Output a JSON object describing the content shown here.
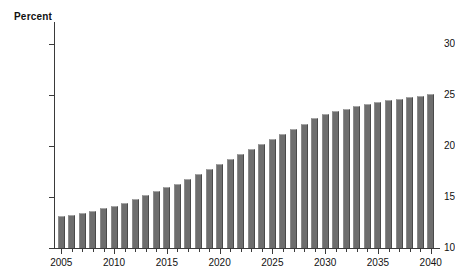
{
  "chart_data": {
    "type": "bar",
    "title": "",
    "subtitle": "",
    "ylabel": "Percent",
    "xlabel": "",
    "ylim": [
      10,
      30
    ],
    "xlim": [
      2005,
      2040
    ],
    "grid": false,
    "legend": "none",
    "y_ticks": [
      10,
      15,
      20,
      25,
      30
    ],
    "y_tick_labels": [
      "10",
      "15",
      "20",
      "25",
      "30"
    ],
    "x_tick_labels": [
      "2005",
      "2010",
      "2015",
      "2020",
      "2025",
      "2030",
      "2035",
      "2040"
    ],
    "x_tick_values": [
      2005,
      2010,
      2015,
      2020,
      2025,
      2030,
      2035,
      2040
    ],
    "bar_color": "#6e6e6e",
    "categories": [
      2005,
      2006,
      2007,
      2008,
      2009,
      2010,
      2011,
      2012,
      2013,
      2014,
      2015,
      2016,
      2017,
      2018,
      2019,
      2020,
      2021,
      2022,
      2023,
      2024,
      2025,
      2026,
      2027,
      2028,
      2029,
      2030,
      2031,
      2032,
      2033,
      2034,
      2035,
      2036,
      2037,
      2038,
      2039,
      2040
    ],
    "values": [
      13.1,
      13.2,
      13.4,
      13.6,
      13.9,
      14.1,
      14.4,
      14.8,
      15.2,
      15.6,
      16.0,
      16.3,
      16.8,
      17.3,
      17.7,
      18.2,
      18.7,
      19.2,
      19.7,
      20.2,
      20.7,
      21.2,
      21.7,
      22.2,
      22.7,
      23.1,
      23.4,
      23.6,
      23.9,
      24.1,
      24.3,
      24.5,
      24.6,
      24.8,
      24.9,
      25.1
    ]
  }
}
